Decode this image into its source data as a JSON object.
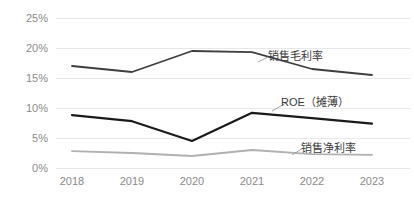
{
  "chart_data": {
    "type": "line",
    "title": "",
    "xlabel": "",
    "ylabel": "",
    "ylim": [
      0,
      25
    ],
    "ytick_labels": [
      "25%",
      "20%",
      "15%",
      "10%",
      "5%",
      "0%"
    ],
    "ytick_values": [
      25,
      20,
      15,
      10,
      5,
      0
    ],
    "grid": true,
    "legend_position": "inline-right",
    "categories": [
      "2018",
      "2019",
      "2020",
      "2021",
      "2022",
      "2023"
    ],
    "series": [
      {
        "name": "销售毛利率",
        "color": "#3f3f3f",
        "values": [
          17.0,
          16.0,
          19.5,
          19.3,
          16.5,
          15.5
        ]
      },
      {
        "name": "ROE（摊薄）",
        "color": "#1a1a1a",
        "values": [
          8.8,
          7.8,
          4.5,
          9.2,
          8.3,
          7.4
        ]
      },
      {
        "name": "销售净利率",
        "color": "#b0b0b0",
        "values": [
          2.8,
          2.5,
          2.0,
          3.0,
          2.3,
          2.2
        ]
      }
    ]
  },
  "axis": {
    "y_ticks": [
      {
        "label": "25%"
      },
      {
        "label": "20%"
      },
      {
        "label": "15%"
      },
      {
        "label": "10%"
      },
      {
        "label": "5%"
      },
      {
        "label": "0%"
      }
    ],
    "x_ticks": [
      {
        "label": "2018"
      },
      {
        "label": "2019"
      },
      {
        "label": "2020"
      },
      {
        "label": "2021"
      },
      {
        "label": "2022"
      },
      {
        "label": "2023"
      }
    ]
  },
  "labels": {
    "gross_margin": "销售毛利率",
    "roe": "ROE（摊薄）",
    "net_margin": "销售净利率"
  },
  "colors": {
    "gridline": "#e8e8e8",
    "tick_text": "#8a8a8a",
    "label_text": "#3a3a3a",
    "gross_margin_line": "#3f3f3f",
    "roe_line": "#1a1a1a",
    "net_margin_line": "#b0b0b0",
    "background": "#ffffff"
  }
}
